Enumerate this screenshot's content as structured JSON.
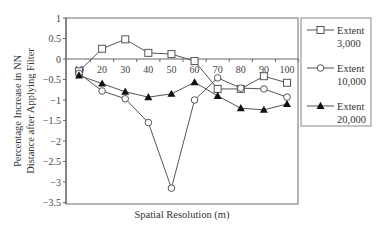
{
  "chart_data": {
    "type": "line",
    "title": "",
    "xlabel": "Spatial Resolution (m)",
    "ylabel": [
      "Percentage Increase in NN",
      "Distance after Applying Filter"
    ],
    "x": [
      10,
      20,
      30,
      40,
      50,
      60,
      70,
      80,
      90,
      100
    ],
    "x_ticks": [
      "10",
      "20",
      "30",
      "40",
      "50",
      "60",
      "70",
      "80",
      "90",
      "100"
    ],
    "y_ticks": [
      "1",
      "0.5",
      "0",
      "-0.5",
      "-1",
      "-1.5",
      "-2",
      "-2.5",
      "-3",
      "-3.5"
    ],
    "y_tick_values": [
      1,
      0.5,
      0,
      -0.5,
      -1,
      -1.5,
      -2,
      -2.5,
      -3,
      -3.5
    ],
    "ylim": [
      -3.5,
      1
    ],
    "xlim": [
      10,
      100
    ],
    "grid": false,
    "legend_position": "right",
    "series": [
      {
        "name": "Extent 3,000",
        "legend_line1": "Extent",
        "legend_line2": "3,000",
        "marker": "square",
        "values": [
          -0.3,
          0.25,
          0.48,
          0.15,
          0.12,
          -0.05,
          -0.73,
          -0.73,
          -0.42,
          -0.58
        ]
      },
      {
        "name": "Extent 10,000",
        "legend_line1": "Extent",
        "legend_line2": "10,000",
        "marker": "circle",
        "values": [
          -0.35,
          -0.78,
          -0.97,
          -1.55,
          -3.15,
          -1.0,
          -0.46,
          -0.71,
          -0.73,
          -0.93
        ]
      },
      {
        "name": "Extent 20,000",
        "legend_line1": "Extent",
        "legend_line2": "20,000",
        "marker": "triangle",
        "values": [
          -0.4,
          -0.6,
          -0.8,
          -0.93,
          -0.85,
          -0.57,
          -0.9,
          -1.2,
          -1.24,
          -1.1
        ]
      }
    ]
  },
  "colors": {
    "line": "#555555",
    "axis": "#666666",
    "text": "#333333"
  }
}
